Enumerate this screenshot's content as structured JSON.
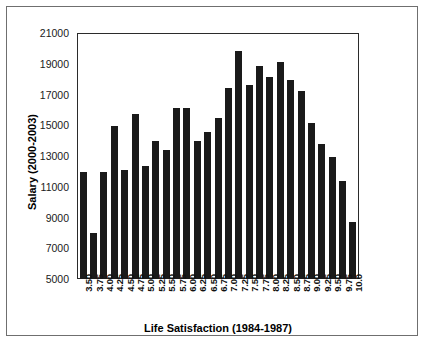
{
  "chart_data": {
    "type": "bar",
    "title": "",
    "xlabel": "Life Satisfaction (1984-1987)",
    "ylabel": "Salary (2000-2003)",
    "ylim": [
      5000,
      21000
    ],
    "ytick_step": 2000,
    "yticks": [
      21000,
      19000,
      17000,
      15000,
      13000,
      11000,
      9000,
      7000,
      5000
    ],
    "ytick_labels": [
      "21000",
      "19000",
      "17000",
      "15000",
      "13000",
      "11000",
      "9000",
      "7000",
      "5000"
    ],
    "grid": false,
    "legend": null,
    "bar_color": "#1a1a1a",
    "categories": [
      "3.50",
      "3.75",
      "4.00",
      "4.25",
      "4.50",
      "4.75",
      "5.00",
      "5.25",
      "5.50",
      "5.75",
      "6.00",
      "6.25",
      "6.50",
      "6.75",
      "7.00",
      "7.25",
      "7.50",
      "7.75",
      "8.00",
      "8.25",
      "8.50",
      "8.75",
      "9.00",
      "9.25",
      "9.50",
      "9.75",
      "10.0"
    ],
    "values": [
      12000,
      8000,
      12000,
      15000,
      12100,
      15800,
      12400,
      14000,
      13400,
      16200,
      16200,
      14000,
      14600,
      15500,
      17500,
      19900,
      17700,
      18900,
      18200,
      19200,
      18000,
      17300,
      15200,
      13800,
      13000,
      11400,
      8700
    ]
  }
}
